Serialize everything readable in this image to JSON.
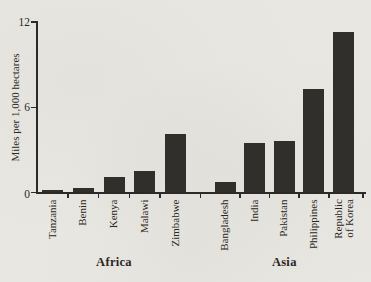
{
  "figure": {
    "background_color": "#e9e7e2",
    "bar_color": "#312f2c",
    "axis_color": "#2b2a27",
    "text_color": "#2b2823"
  },
  "chart_data": {
    "type": "bar",
    "ylabel": "Miles per 1,000 hectares",
    "ylim": [
      0,
      12
    ],
    "yticks": [
      0,
      6,
      12
    ],
    "grid": false,
    "legend": "none",
    "groups": [
      {
        "label": "Africa",
        "categories": [
          "Tanzania",
          "Benin",
          "Kenya",
          "Malawi",
          "Zimbabwe"
        ],
        "values": [
          0.2,
          0.35,
          1.1,
          1.5,
          4.1
        ]
      },
      {
        "label": "Asia",
        "categories": [
          "Bangladesh",
          "India",
          "Pakistan",
          "Philippines",
          "Republic\nof Korea"
        ],
        "values": [
          0.75,
          3.5,
          3.6,
          7.3,
          11.3
        ]
      }
    ]
  }
}
